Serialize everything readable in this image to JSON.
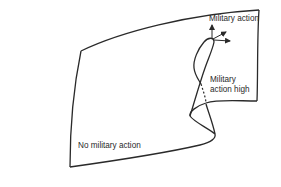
{
  "diagram": {
    "type": "cusp-catastrophe-surface",
    "colors": {
      "stroke": "#2a2a2a",
      "background": "#ffffff",
      "text": "#2a2a2a"
    },
    "labels": {
      "top": "Military action",
      "high_line1": "Military",
      "high_line2": "action high",
      "bottom": "No military action"
    },
    "arrows": [
      {
        "direction": "up"
      },
      {
        "direction": "up-right"
      },
      {
        "direction": "right"
      }
    ]
  }
}
